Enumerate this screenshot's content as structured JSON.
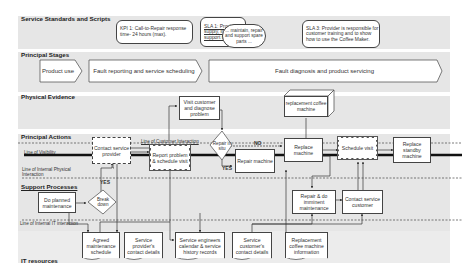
{
  "lanes": {
    "standards": "Service Standards and Scripts",
    "stages": "Principal Stages",
    "evidence": "Physical Evidence",
    "actions": "Principal Actions",
    "support": "Support Processes",
    "it": "IT resources"
  },
  "lines": {
    "customer_interaction": "Line of Customer Interaction",
    "visibility": "Line of Visibility",
    "internal_physical": "Line of Internal Physical Interaction",
    "internal_it": "Line of Internal IT interaction"
  },
  "standards": {
    "kpi1": "KPI 1: Call-to-Repair response time- 24 hours (max).",
    "sla1": "SLA 1: Provider to supply, install, support the w...",
    "sla1_callout": "... maintain, repair and support spare parts ...",
    "sla3": "SLA 3: Provider is responsible for customer training and to show how to use the Coffee Maker."
  },
  "stages": [
    "Product use",
    "Fault reporting and service scheduling",
    "Fault diagnosis and product servicing"
  ],
  "evidence": {
    "visit": "Visit customer and diagnose problem",
    "replacement": "replacement coffee machine"
  },
  "actions": {
    "contact_provider": "Contact service provider",
    "report_problem": "Report problem & schedule visit",
    "repair_decision": "Repair in situ",
    "repair_machine": "Repair machine",
    "replace_machine": "Replace machine",
    "schedule_visit": "Schedule visit",
    "replace_standby": "Replace standby machine"
  },
  "support": {
    "planned_maintenance": "Do planned maintenance",
    "breakdown": "Break down",
    "repair_imminent": "Repair & do imminent maintenance",
    "contact_customer": "Contact service customer"
  },
  "it": {
    "agreed_schedule": "Agreed maintenance schedule",
    "provider_contact": "Service provider's contact details",
    "engineers_calendar": "Service engineers calendar & service history records",
    "customer_contact": "Service customer's contact details",
    "replacement_info": "Replacement coffee machine information"
  },
  "labels": {
    "yes": "YES",
    "no": "NO"
  }
}
